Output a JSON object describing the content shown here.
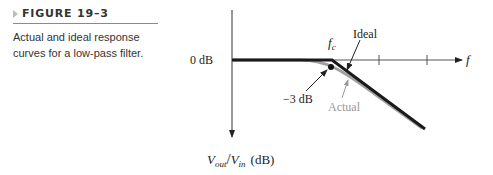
{
  "caption": {
    "figure_label": "FIGURE 19–3",
    "description": "Actual and ideal response curves for a low-pass filter."
  },
  "diagram": {
    "y_axis_label_v": "V",
    "y_axis_label_out": "out",
    "y_axis_label_slash": "/",
    "y_axis_label_vin": "V",
    "y_axis_label_in": "in",
    "y_axis_label_unit": "(dB)",
    "x_axis_label": "f",
    "zero_db_label": "0 dB",
    "fc_label_f": "f",
    "fc_label_c": "c",
    "ideal_label": "Ideal",
    "actual_label": "Actual",
    "minus3db_label": "−3 dB",
    "colors": {
      "ideal": "#1a1a1a",
      "actual": "#a0a0a0",
      "axis": "#333333"
    }
  }
}
